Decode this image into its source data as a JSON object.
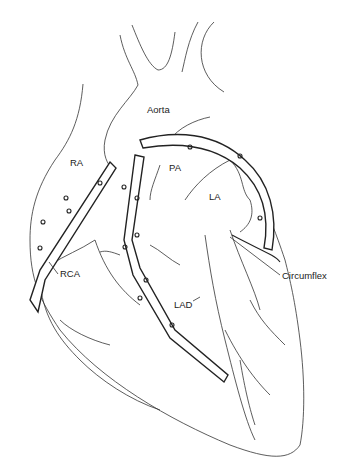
{
  "diagram": {
    "type": "anatomical line drawing",
    "labels": {
      "aorta": "Aorta",
      "ra": "RA",
      "pa": "PA",
      "la": "LA",
      "rca": "RCA",
      "lad": "LAD",
      "circumflex": "Circumflex"
    },
    "colors": {
      "line": "#222222",
      "background": "#ffffff"
    }
  }
}
